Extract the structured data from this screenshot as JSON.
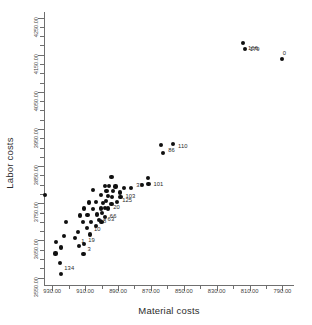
{
  "chart_data": {
    "type": "scatter",
    "title": "",
    "xlabel": "Material costs",
    "ylabel": "Labor costs",
    "xlim": [
      935.0,
      783.0
    ],
    "ylim": [
      4265.0,
      3530.0
    ],
    "x_reversed": true,
    "y_reversed": true,
    "grid": false,
    "legend": null,
    "xticks": [
      930.0,
      910.0,
      890.0,
      870.0,
      850.0,
      830.0,
      810.0,
      790.0
    ],
    "xtick_labels": [
      "930.00",
      "910.00",
      "890.00",
      "870.00",
      "850.00",
      "830.00",
      "810.00",
      "790.00"
    ],
    "x_minor_step": 10,
    "yticks": [
      3550.0,
      3650.0,
      3750.0,
      3850.0,
      3950.0,
      4050.0,
      4150.0,
      4250.0
    ],
    "ytick_labels": [
      "3550.00",
      "3650.00",
      "3750.00",
      "3850.00",
      "3950.00",
      "4050.00",
      "4150.00",
      "4250.00"
    ],
    "y_minor_step": 25,
    "marker": "filled-circle",
    "marker_color": "#101010",
    "points": [
      {
        "x": 924.5,
        "y": 3560.0,
        "label": "134",
        "lx": 3,
        "ly": -9
      },
      {
        "x": 925.5,
        "y": 3589.0,
        "label": "",
        "lx": 0,
        "ly": 0
      },
      {
        "x": 928.0,
        "y": 3615.0,
        "label": "",
        "lx": 0,
        "ly": 0
      },
      {
        "x": 924.5,
        "y": 3631.0,
        "label": "",
        "lx": 0,
        "ly": 0
      },
      {
        "x": 927.5,
        "y": 3645.0,
        "label": "",
        "lx": 0,
        "ly": 0
      },
      {
        "x": 923.0,
        "y": 3663.0,
        "label": "",
        "lx": 0,
        "ly": 0
      },
      {
        "x": 921.5,
        "y": 3700.0,
        "label": "",
        "lx": 0,
        "ly": 0
      },
      {
        "x": 934.5,
        "y": 3773.0,
        "label": "",
        "lx": 0,
        "ly": 0
      },
      {
        "x": 911.0,
        "y": 3613.0,
        "label": "3",
        "lx": 4,
        "ly": -8
      },
      {
        "x": 913.5,
        "y": 3635.0,
        "label": "1",
        "lx": 2,
        "ly": -8
      },
      {
        "x": 910.5,
        "y": 3640.0,
        "label": "19",
        "lx": 4,
        "ly": -7
      },
      {
        "x": 916.0,
        "y": 3657.0,
        "label": "",
        "lx": 0,
        "ly": 0
      },
      {
        "x": 907.0,
        "y": 3666.0,
        "label": "10",
        "lx": 4,
        "ly": -8
      },
      {
        "x": 914.5,
        "y": 3672.0,
        "label": "",
        "lx": 0,
        "ly": 0
      },
      {
        "x": 909.0,
        "y": 3683.0,
        "label": "",
        "lx": 0,
        "ly": 0
      },
      {
        "x": 903.5,
        "y": 3688.0,
        "label": "18",
        "lx": 4,
        "ly": -8
      },
      {
        "x": 911.5,
        "y": 3700.0,
        "label": "",
        "lx": 0,
        "ly": 0
      },
      {
        "x": 906.5,
        "y": 3699.0,
        "label": "",
        "lx": 0,
        "ly": 0
      },
      {
        "x": 900.0,
        "y": 3700.0,
        "label": "63",
        "lx": 6,
        "ly": -6
      },
      {
        "x": 901.5,
        "y": 3706.0,
        "label": "",
        "lx": 0,
        "ly": 0
      },
      {
        "x": 898.0,
        "y": 3712.0,
        "label": "66",
        "lx": 5,
        "ly": -4
      },
      {
        "x": 913.0,
        "y": 3717.0,
        "label": "",
        "lx": 0,
        "ly": 0
      },
      {
        "x": 908.5,
        "y": 3719.0,
        "label": "",
        "lx": 0,
        "ly": 0
      },
      {
        "x": 903.0,
        "y": 3720.0,
        "label": "",
        "lx": 0,
        "ly": 0
      },
      {
        "x": 899.5,
        "y": 3724.0,
        "label": "",
        "lx": 0,
        "ly": 0
      },
      {
        "x": 910.5,
        "y": 3736.0,
        "label": "",
        "lx": 0,
        "ly": 0
      },
      {
        "x": 905.0,
        "y": 3735.0,
        "label": "",
        "lx": 0,
        "ly": 0
      },
      {
        "x": 900.5,
        "y": 3736.0,
        "label": "",
        "lx": 0,
        "ly": 0
      },
      {
        "x": 898.0,
        "y": 3738.0,
        "label": "",
        "lx": 0,
        "ly": 0
      },
      {
        "x": 896.0,
        "y": 3736.0,
        "label": "20",
        "lx": 5,
        "ly": -4
      },
      {
        "x": 907.5,
        "y": 3752.0,
        "label": "",
        "lx": 0,
        "ly": 0
      },
      {
        "x": 903.5,
        "y": 3753.0,
        "label": "",
        "lx": 0,
        "ly": 0
      },
      {
        "x": 899.0,
        "y": 3751.0,
        "label": "",
        "lx": 0,
        "ly": 0
      },
      {
        "x": 897.5,
        "y": 3757.0,
        "label": "",
        "lx": 0,
        "ly": 0
      },
      {
        "x": 894.0,
        "y": 3748.0,
        "label": "",
        "lx": 0,
        "ly": 0
      },
      {
        "x": 890.5,
        "y": 3754.0,
        "label": "125",
        "lx": 5,
        "ly": -5
      },
      {
        "x": 900.5,
        "y": 3772.0,
        "label": "",
        "lx": 0,
        "ly": 0
      },
      {
        "x": 896.0,
        "y": 3770.0,
        "label": "",
        "lx": 0,
        "ly": 0
      },
      {
        "x": 893.5,
        "y": 3766.0,
        "label": "",
        "lx": 0,
        "ly": 0
      },
      {
        "x": 888.5,
        "y": 3768.0,
        "label": "103",
        "lx": 5,
        "ly": -4
      },
      {
        "x": 905.0,
        "y": 3785.0,
        "label": "",
        "lx": 0,
        "ly": 0
      },
      {
        "x": 897.0,
        "y": 3784.0,
        "label": "",
        "lx": 0,
        "ly": 0
      },
      {
        "x": 893.0,
        "y": 3782.0,
        "label": "",
        "lx": 0,
        "ly": 0
      },
      {
        "x": 889.0,
        "y": 3779.0,
        "label": "",
        "lx": 0,
        "ly": 0
      },
      {
        "x": 898.0,
        "y": 3797.0,
        "label": "",
        "lx": 0,
        "ly": 0
      },
      {
        "x": 895.5,
        "y": 3796.0,
        "label": "",
        "lx": 0,
        "ly": 0
      },
      {
        "x": 891.5,
        "y": 3795.0,
        "label": "",
        "lx": 0,
        "ly": 0
      },
      {
        "x": 886.5,
        "y": 3792.0,
        "label": "",
        "lx": 0,
        "ly": 0
      },
      {
        "x": 882.0,
        "y": 3791.0,
        "label": "37",
        "lx": 5,
        "ly": -6
      },
      {
        "x": 875.5,
        "y": 3800.0,
        "label": "",
        "lx": 0,
        "ly": 0
      },
      {
        "x": 871.5,
        "y": 3801.0,
        "label": "101",
        "lx": 5,
        "ly": -3
      },
      {
        "x": 872.0,
        "y": 3817.0,
        "label": "",
        "lx": 0,
        "ly": 0
      },
      {
        "x": 894.0,
        "y": 3820.0,
        "label": "",
        "lx": 0,
        "ly": 0
      },
      {
        "x": 862.5,
        "y": 3885.0,
        "label": "86",
        "lx": 5,
        "ly": -6
      },
      {
        "x": 864.0,
        "y": 3906.0,
        "label": "",
        "lx": 0,
        "ly": 0
      },
      {
        "x": 856.5,
        "y": 3909.0,
        "label": "110",
        "lx": 5,
        "ly": -1
      },
      {
        "x": 790.5,
        "y": 4138.0,
        "label": "0",
        "lx": 1,
        "ly": -9
      },
      {
        "x": 813.0,
        "y": 4166.0,
        "label": "179",
        "lx": 5,
        "ly": -3
      },
      {
        "x": 814.0,
        "y": 4181.0,
        "label": "166",
        "lx": 5,
        "ly": 2
      }
    ]
  }
}
